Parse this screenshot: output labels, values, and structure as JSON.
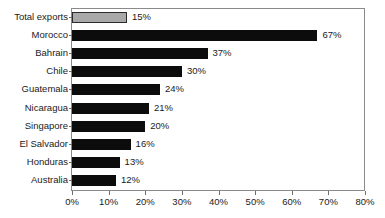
{
  "chart_data": {
    "type": "bar",
    "orientation": "horizontal",
    "title": "",
    "subtitle": "",
    "xlabel": "",
    "ylabel": "",
    "xlim": [
      0,
      80
    ],
    "grid": false,
    "legend": "none",
    "xtick_labels": [
      "0%",
      "10%",
      "20%",
      "30%",
      "40%",
      "50%",
      "60%",
      "70%",
      "80%"
    ],
    "xtick_values": [
      0,
      10,
      20,
      30,
      40,
      50,
      60,
      70,
      80
    ],
    "categories": [
      "Total exports",
      "Morocco",
      "Bahrain",
      "Chile",
      "Guatemala",
      "Nicaragua",
      "Singapore",
      "El Salvador",
      "Honduras",
      "Australia"
    ],
    "values": [
      15,
      67,
      37,
      30,
      24,
      21,
      20,
      16,
      13,
      12
    ],
    "data_labels": [
      "15%",
      "67%",
      "37%",
      "30%",
      "24%",
      "21%",
      "20%",
      "16%",
      "13%",
      "12%"
    ],
    "highlight_index": 0,
    "colors": {
      "bar": "#0c0c0c",
      "highlight_bar": "#a9a9a9",
      "highlight_border": "#2b2b2b",
      "axis": "#8a8a8a",
      "text": "#1a1a1a",
      "background": "#ffffff"
    }
  }
}
